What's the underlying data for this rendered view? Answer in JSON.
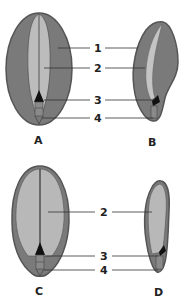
{
  "figure": {
    "type": "seed-anatomy-diagram",
    "panels": [
      {
        "id": "A",
        "label": "A",
        "view": "front",
        "parts": [
          "1",
          "2",
          "3",
          "4"
        ]
      },
      {
        "id": "B",
        "label": "B",
        "view": "side",
        "parts": [
          "1",
          "2",
          "3",
          "4"
        ]
      },
      {
        "id": "C",
        "label": "C",
        "view": "front",
        "parts": [
          "2",
          "3",
          "4"
        ]
      },
      {
        "id": "D",
        "label": "D",
        "view": "side",
        "parts": [
          "2",
          "3",
          "4"
        ]
      }
    ],
    "callouts_top": [
      "1",
      "2",
      "3",
      "4"
    ],
    "callouts_bottom": [
      "2",
      "3",
      "4"
    ]
  },
  "colors": {
    "outer_tissue": "#7a7a7a",
    "outer_edge": "#555555",
    "inner_tissue": "#b5b5b5",
    "inner_tissue_light": "#c4c4c4",
    "embryo": "#111111",
    "leader_line": "#333333",
    "text": "#222222"
  }
}
